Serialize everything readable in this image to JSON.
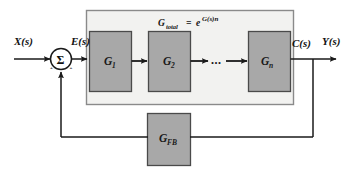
{
  "diagram": {
    "colors": {
      "background": "#ffffff",
      "block_fill": "#a8a8a8",
      "block_stroke": "#4a4a4a",
      "container_fill": "#f2f2f0",
      "container_stroke": "#8a8a8a",
      "line": "#1a1a1a",
      "text": "#111111"
    }
  },
  "signals": {
    "input": "X(s)",
    "error": "E(s)",
    "plant_output": "C(s)",
    "output": "Y(s)"
  },
  "summing_junction": {
    "symbol": "Σ",
    "sign_input": "+",
    "sign_feedback": "+"
  },
  "container": {
    "formula": {
      "base": "G",
      "base_subscript": "total",
      "equals": "=",
      "exp_base": "e",
      "exponent": "G(s)n",
      "full_text": "G_total = e^(G(s)n)"
    }
  },
  "forward_blocks": [
    {
      "label": "G",
      "subscript": "1",
      "name": "block-g1"
    },
    {
      "label": "G",
      "subscript": "2",
      "name": "block-g2"
    },
    {
      "label": "G",
      "subscript": "n",
      "name": "block-gn"
    }
  ],
  "ellipsis": "...",
  "feedback_block": {
    "label": "G",
    "subscript": "FB"
  }
}
